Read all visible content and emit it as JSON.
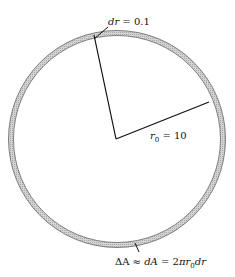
{
  "diagram": {
    "type": "annulus-area-element",
    "colors": {
      "ring_fill": "#c8c8c8",
      "ring_edge": "#555555",
      "line": "#111111",
      "background": "#ffffff"
    },
    "labels": {
      "dr": {
        "var": "dr",
        "eq": " = 0.1"
      },
      "radius": {
        "var": "r",
        "sub": "0",
        "eq": " = 10"
      },
      "area": {
        "part1": "ΔA ≈ ",
        "part2": "dA",
        "part3": " = 2",
        "pi": "π",
        "r": "r",
        "sub": "0",
        "dr": "dr"
      }
    }
  }
}
